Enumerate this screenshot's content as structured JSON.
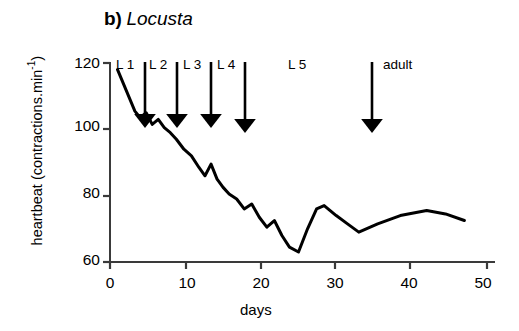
{
  "figure": {
    "panel_label": "b)",
    "species": "Locusta"
  },
  "axes": {
    "y_title": "heartbeat (contractions.min",
    "y_title_exp": "-1",
    "y_title_close": ")",
    "x_title": "days",
    "y_ticks": [
      "60",
      "80",
      "100",
      "120"
    ],
    "x_ticks": [
      "0",
      "10",
      "20",
      "30",
      "40",
      "50"
    ]
  },
  "stages": [
    {
      "label": "L 1",
      "label_x": 126,
      "arrow_x": 145,
      "arrow_day": 4.7
    },
    {
      "label": "L 2",
      "label_x": 159,
      "arrow_x": 177,
      "arrow_day": 9.0
    },
    {
      "label": "L 3",
      "label_x": 193,
      "arrow_x": 211,
      "arrow_day": 13.5
    },
    {
      "label": "L 4",
      "label_x": 227,
      "arrow_x": 245,
      "arrow_day": 18.0
    },
    {
      "label": "L 5",
      "label_x": 296,
      "arrow_x": null,
      "arrow_day": null
    },
    {
      "label": "adult",
      "label_x": 383,
      "arrow_x": 372,
      "arrow_day": 35.0
    }
  ],
  "chart_data": {
    "type": "line",
    "title": "b) Locusta",
    "xlabel": "days",
    "ylabel": "heartbeat (contractions.min-1)",
    "xlim": [
      0,
      50
    ],
    "ylim": [
      60,
      120
    ],
    "xticks": [
      0,
      10,
      20,
      30,
      40,
      50
    ],
    "yticks": [
      60,
      80,
      100,
      120
    ],
    "grid": false,
    "legend": null,
    "annotations": [
      {
        "text": "L 1",
        "day": 4.7,
        "type": "moult-arrow"
      },
      {
        "text": "L 2",
        "day": 9.0,
        "type": "moult-arrow"
      },
      {
        "text": "L 3",
        "day": 13.5,
        "type": "moult-arrow"
      },
      {
        "text": "L 4",
        "day": 18.0,
        "type": "moult-arrow"
      },
      {
        "text": "L 5",
        "day": 26.0,
        "type": "stage-label"
      },
      {
        "text": "adult",
        "day": 35.0,
        "type": "moult-arrow"
      }
    ],
    "x": [
      1.0,
      3.3,
      4.0,
      4.8,
      5.6,
      6.4,
      7.2,
      8.0,
      8.8,
      9.8,
      10.8,
      11.8,
      12.6,
      13.4,
      14.2,
      15.0,
      15.8,
      16.8,
      17.8,
      18.8,
      19.8,
      20.8,
      21.8,
      22.8,
      23.8,
      25.0,
      26.2,
      27.4,
      28.4,
      30.0,
      31.5,
      33.0,
      35.5,
      38.5,
      42.0,
      44.5,
      47.0
    ],
    "y": [
      118.0,
      105.5,
      103.5,
      105.0,
      101.5,
      103.0,
      100.5,
      99.0,
      97.0,
      94.0,
      92.0,
      88.5,
      86.0,
      89.5,
      85.0,
      82.5,
      80.5,
      79.0,
      76.0,
      77.5,
      73.5,
      70.5,
      72.5,
      68.0,
      64.5,
      63.0,
      70.0,
      76.0,
      77.0,
      74.0,
      71.5,
      69.0,
      71.5,
      74.0,
      75.5,
      74.5,
      72.5
    ]
  },
  "style": {
    "line_color": "#000000",
    "axis_color": "#3a3a3a",
    "background": "#ffffff"
  }
}
